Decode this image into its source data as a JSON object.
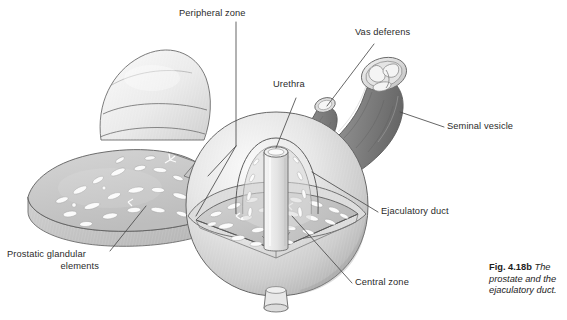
{
  "figure": {
    "caption_number": "Fig. 4.18b",
    "caption_text": "The prostate and the ejaculatory duct.",
    "caption_line1": "The",
    "caption_line2": "prostate and the",
    "caption_line3": "ejaculatory duct."
  },
  "labels": {
    "peripheral_zone": "Peripheral zone",
    "urethra": "Urethra",
    "vas_deferens": "Vas deferens",
    "seminal_vesicle": "Seminal vesicle",
    "ejaculatory_duct": "Ejaculatory duct",
    "central_zone": "Central zone",
    "prostatic_glandular_line1": "Prostatic glandular",
    "prostatic_glandular_line2": "elements"
  },
  "colors": {
    "background": "#ffffff",
    "outline": "#555555",
    "leader_line": "#4a4a4a",
    "text": "#2b2b2b",
    "prostate_light": "#f2f2f2",
    "prostate_mid": "#d8d8d8",
    "prostate_shadow": "#bdbdbd",
    "cut_surface": "#c9c9c9",
    "gland_white": "#fbfbfb",
    "duct_dark": "#8a8a8a",
    "duct_darker": "#757575",
    "urethra_pale": "#eaeaea"
  },
  "structures": [
    {
      "name": "peripheral-zone-detached-cap",
      "description": "detached dome-shaped wedge of peripheral zone, upper left"
    },
    {
      "name": "peripheral-zone-detached-slab",
      "description": "detached wedge slab showing cut glandular surface, left"
    },
    {
      "name": "prostate-body",
      "description": "main spherical prostate body with cut-away quadrant"
    },
    {
      "name": "urethra-column",
      "description": "pale vertical cylinder through prostate center"
    },
    {
      "name": "urethra-distal-stub",
      "description": "small cylinder at base of prostate"
    },
    {
      "name": "central-zone-dome",
      "description": "inner dome around the urethra"
    },
    {
      "name": "vas-deferens-tube",
      "description": "narrow dark tube with light elliptical cut end"
    },
    {
      "name": "seminal-vesicle-tube",
      "description": "wide dark convoluted tube with light cut face showing lumens"
    },
    {
      "name": "ejaculatory-duct",
      "description": "duct entering prostate from seminal vesicle"
    }
  ]
}
